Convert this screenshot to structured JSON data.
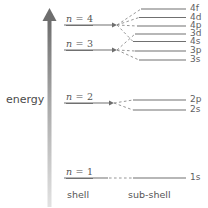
{
  "diagram": {
    "axis": {
      "label": "energy",
      "direction": "up",
      "arrow_color_top": "#6b6b6b",
      "arrow_color_bottom": "#dcdcdc"
    },
    "columns": [
      {
        "id": "shell",
        "label": "shell"
      },
      {
        "id": "sub-shell",
        "label": "sub-shell"
      }
    ],
    "line_color": "#707070",
    "dash_color": "#8a8a8a",
    "shells": [
      {
        "id": "n4",
        "label": "n = 4",
        "n": 4,
        "y": 25
      },
      {
        "id": "n3",
        "label": "n = 3",
        "n": 3,
        "y": 50
      },
      {
        "id": "n2",
        "label": "n = 2",
        "n": 2,
        "y": 103
      },
      {
        "id": "n1",
        "label": "n = 1",
        "n": 1,
        "y": 178
      }
    ],
    "subshells": [
      {
        "id": "4f",
        "label": "4f",
        "shell": 4,
        "y": 9
      },
      {
        "id": "4d",
        "label": "4d",
        "shell": 4,
        "y": 17.5
      },
      {
        "id": "4p",
        "label": "4p",
        "shell": 4,
        "y": 26
      },
      {
        "id": "3d",
        "label": "3d",
        "shell": 3,
        "y": 34
      },
      {
        "id": "4s",
        "label": "4s",
        "shell": 4,
        "y": 41.5
      },
      {
        "id": "3p",
        "label": "3p",
        "shell": 3,
        "y": 51
      },
      {
        "id": "3s",
        "label": "3s",
        "shell": 3,
        "y": 60
      },
      {
        "id": "2p",
        "label": "2p",
        "shell": 2,
        "y": 100
      },
      {
        "id": "2s",
        "label": "2s",
        "shell": 2,
        "y": 110
      },
      {
        "id": "1s",
        "label": "1s",
        "shell": 1,
        "y": 178
      }
    ]
  }
}
